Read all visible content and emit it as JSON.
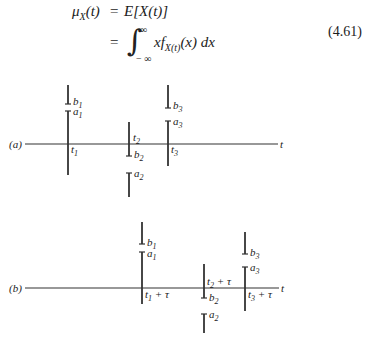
{
  "equation": {
    "line1_lhs": "μ",
    "line1_lhs_sub": "X",
    "line1_lhs_arg": "(t)",
    "equals": "=",
    "line1_rhs": "E[X(t)]",
    "line2_equals": "=",
    "integral_symbol": "∫",
    "integral_upper": "∞",
    "integral_lower": "− ∞",
    "integrand_pre": "xf",
    "integrand_sub": "X(t)",
    "integrand_post": "(x)  dx",
    "number": "(4.61)"
  },
  "diagram_a": {
    "label": "(a)",
    "axis_label": "t",
    "impulses": [
      {
        "time": "t",
        "time_sub": "1",
        "upper": "b",
        "upper_sub": "1",
        "lower": "a",
        "lower_sub": "1"
      },
      {
        "time": "t",
        "time_sub": "2",
        "upper": "b",
        "upper_sub": "2",
        "lower": "a",
        "lower_sub": "2"
      },
      {
        "time": "t",
        "time_sub": "3",
        "upper": "b",
        "upper_sub": "3",
        "lower": "a",
        "lower_sub": "3"
      }
    ]
  },
  "diagram_b": {
    "label": "(b)",
    "axis_label": "t",
    "tau_suffix": " + τ",
    "impulses": [
      {
        "time": "t",
        "time_sub": "1",
        "upper": "b",
        "upper_sub": "1",
        "lower": "a",
        "lower_sub": "1"
      },
      {
        "time": "t",
        "time_sub": "2",
        "upper": "b",
        "upper_sub": "2",
        "lower": "a",
        "lower_sub": "2"
      },
      {
        "time": "t",
        "time_sub": "3",
        "upper": "b",
        "upper_sub": "3",
        "lower": "a",
        "lower_sub": "3"
      }
    ]
  }
}
